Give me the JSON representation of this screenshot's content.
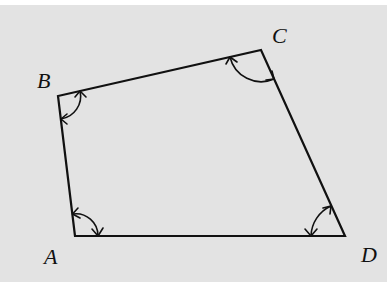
{
  "figure": {
    "type": "quadrilateral",
    "background": "#e3e3e3",
    "vertices": [
      {
        "name": "A",
        "label": "A"
      },
      {
        "name": "B",
        "label": "B"
      },
      {
        "name": "C",
        "label": "C"
      },
      {
        "name": "D",
        "label": "D"
      }
    ],
    "edges": [
      "AB",
      "BC",
      "CD",
      "DA"
    ],
    "angle_markers": [
      {
        "vertex": "A",
        "style": "double-headed arc"
      },
      {
        "vertex": "B",
        "style": "double-headed arc"
      },
      {
        "vertex": "C",
        "style": "double-headed arc"
      },
      {
        "vertex": "D",
        "style": "double-headed arc"
      }
    ]
  }
}
